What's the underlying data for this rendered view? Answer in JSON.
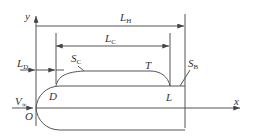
{
  "diagram": {
    "title": "",
    "colors": {
      "stroke": "#555555",
      "text": "#333333",
      "background": "#ffffff"
    },
    "axes": {
      "y_label": "y",
      "x_label": "x",
      "origin_label": "O"
    },
    "dimensions": [
      {
        "id": "LH",
        "main": "L",
        "sub": "H"
      },
      {
        "id": "LC",
        "main": "L",
        "sub": "C"
      },
      {
        "id": "LD",
        "main": "L",
        "sub": "D"
      }
    ],
    "points": {
      "D": "D",
      "T": "T",
      "L": "L"
    },
    "surfaces": [
      {
        "id": "SC",
        "main": "S",
        "sub": "C"
      },
      {
        "id": "SB",
        "main": "S",
        "sub": "B"
      }
    ],
    "flow": {
      "main": "V",
      "sub": "∞"
    }
  }
}
